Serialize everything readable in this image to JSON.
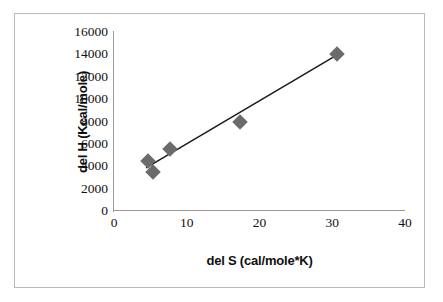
{
  "chart_data": {
    "type": "scatter",
    "title": "",
    "xlabel": "del S (cal/mole*K)",
    "ylabel": "del H (Kcal/mole)",
    "xlim": [
      0,
      40
    ],
    "ylim": [
      0,
      16000
    ],
    "grid": false,
    "legend": "none",
    "x_ticks": [
      "0",
      "10",
      "20",
      "30",
      "40"
    ],
    "x_tick_values": [
      0,
      10,
      20,
      30,
      40
    ],
    "y_ticks": [
      "0",
      "2000",
      "4000",
      "6000",
      "8000",
      "10000",
      "12000",
      "14000",
      "16000"
    ],
    "y_tick_values": [
      0,
      2000,
      4000,
      6000,
      8000,
      10000,
      12000,
      14000,
      16000
    ],
    "series": [
      {
        "name": "data",
        "marker": "diamond",
        "color": "#6b6b6b",
        "points": [
          {
            "x": 4.7,
            "y": 4500
          },
          {
            "x": 5.3,
            "y": 3500
          },
          {
            "x": 7.7,
            "y": 5500
          },
          {
            "x": 17.3,
            "y": 8000
          },
          {
            "x": 30.6,
            "y": 14000
          }
        ]
      }
    ],
    "trendline": {
      "name": "linear fit",
      "color": "#1a1a1a",
      "x_start": 4.4,
      "y_start": 3850,
      "x_end": 30.9,
      "y_end": 14050
    }
  },
  "figure": {
    "background": "#ffffff",
    "border_color": "#b9b9b9",
    "axis_color": "#999999",
    "text_color": "#111111"
  }
}
